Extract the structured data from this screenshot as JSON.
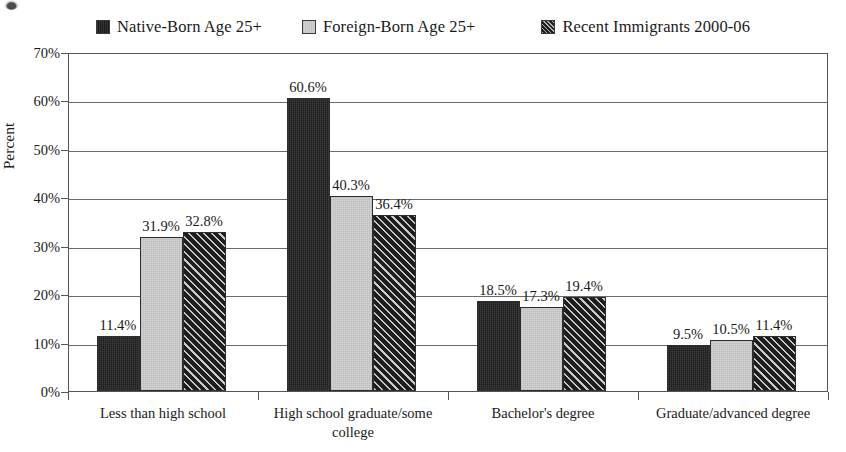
{
  "chart_data": {
    "type": "bar",
    "title": "",
    "subtitle": "",
    "xlabel": "",
    "ylabel": "Percent",
    "ylim": [
      0,
      70
    ],
    "ytick_labels": [
      "0%",
      "10%",
      "20%",
      "30%",
      "40%",
      "50%",
      "60%",
      "70%"
    ],
    "ytick_values": [
      0,
      10,
      20,
      30,
      40,
      50,
      60,
      70
    ],
    "grid": true,
    "legend_position": "top-center",
    "value_label_suffix": "%",
    "categories": [
      "Less than high school",
      "High school graduate/some college",
      "Bachelor's degree",
      "Graduate/advanced degree"
    ],
    "series": [
      {
        "name": "Native-Born Age 25+",
        "fill": "solid-black",
        "color": "#1c1c1c",
        "values": [
          11.4,
          60.6,
          18.5,
          9.5
        ],
        "labels": [
          "11.4%",
          "60.6%",
          "18.5%",
          "9.5%"
        ]
      },
      {
        "name": "Foreign-Born Age 25+",
        "fill": "light-gray",
        "color": "#d4d4d4",
        "values": [
          31.9,
          40.3,
          17.3,
          10.5
        ],
        "labels": [
          "31.9%",
          "40.3%",
          "17.3%",
          "10.5%"
        ]
      },
      {
        "name": "Recent Immigrants 2000-06",
        "fill": "hatched",
        "color": "#1e1e1e",
        "values": [
          32.8,
          36.4,
          19.4,
          11.4
        ],
        "labels": [
          "32.8%",
          "36.4%",
          "19.4%",
          "11.4%"
        ]
      }
    ]
  },
  "legend": {
    "items": [
      {
        "label": "Native-Born Age 25+",
        "swatch": "solid-black-swatch"
      },
      {
        "label": "Foreign-Born Age 25+",
        "swatch": "light-gray-swatch"
      },
      {
        "label": "Recent Immigrants 2000-06",
        "swatch": "hatched-swatch"
      }
    ]
  },
  "axes": {
    "y_title": "Percent"
  }
}
